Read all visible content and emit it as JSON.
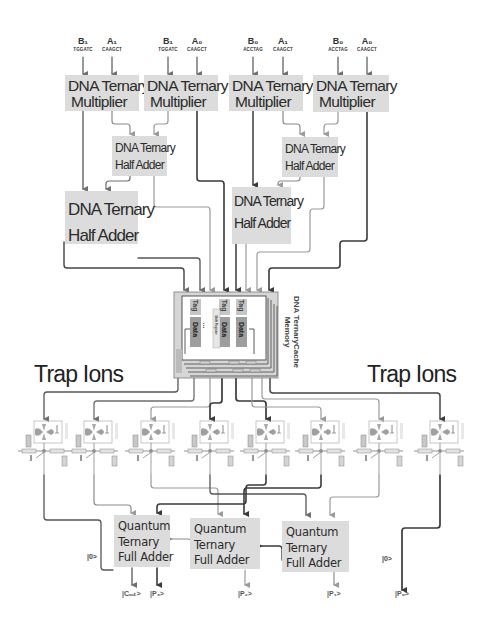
{
  "inputs": [
    {
      "id": "b1a",
      "symbol": "B₁",
      "sequence": "TGGATC",
      "x": 83
    },
    {
      "id": "a1a",
      "symbol": "A₁",
      "sequence": "CAAGCT",
      "x": 112
    },
    {
      "id": "b1b",
      "symbol": "B₁",
      "sequence": "TGGATC",
      "x": 168
    },
    {
      "id": "a0a",
      "symbol": "A₀",
      "sequence": "CAAGCT",
      "x": 197
    },
    {
      "id": "b0a",
      "symbol": "B₀",
      "sequence": "ACCTAG",
      "x": 253
    },
    {
      "id": "a1b",
      "symbol": "A₁",
      "sequence": "CAAGCT",
      "x": 283
    },
    {
      "id": "b0b",
      "symbol": "B₀",
      "sequence": "ACCTAG",
      "x": 338
    },
    {
      "id": "a0b",
      "symbol": "A₀",
      "sequence": "CAAGCT",
      "x": 367
    }
  ],
  "multipliers": [
    {
      "line1": "DNA Ternary",
      "line2": "Multiplier"
    },
    {
      "line1": "DNA Ternary",
      "line2": "Multiplier"
    },
    {
      "line1": "DNA Ternary",
      "line2": "Multiplier"
    },
    {
      "line1": "DNA Ternary",
      "line2": "Multiplier"
    }
  ],
  "half_adders": [
    {
      "line1": "DNA Ternary",
      "line2": "Half Adder"
    },
    {
      "line1": "DNA Ternary",
      "line2": "Half Adder"
    },
    {
      "line1": "DNA Ternary",
      "line2": "Half Adder"
    },
    {
      "line1": "DNA Ternary",
      "line2": "Half Adder"
    }
  ],
  "cache": {
    "title_line1": "DNA TernaryCache",
    "title_line2": "Memory",
    "cells": [
      {
        "tag": "Tag",
        "data": "Data"
      },
      {
        "tag": "Tag",
        "data": "Data",
        "sub": "Shift Register"
      },
      {
        "tag": "Tag",
        "data": "Data"
      }
    ],
    "ellipsis": "..."
  },
  "trap_ions": {
    "left_label": "Trap Ions",
    "right_label": "Trap Ions",
    "unit_side_label": "Trap Ions",
    "count": 8
  },
  "full_adders": [
    {
      "line1": "Quantum",
      "line2": "Ternary",
      "line3": "Full Adder"
    },
    {
      "line1": "Quantum",
      "line2": "Ternary",
      "line3": "Full Adder"
    },
    {
      "line1": "Quantum",
      "line2": "Ternary",
      "line3": "Full Adder"
    }
  ],
  "ancilla": {
    "left": "|0>",
    "right": "|0>"
  },
  "outputs": [
    {
      "label": "|Cₒᵤₜ>"
    },
    {
      "label": "|P₃>"
    },
    {
      "label": "|P₂>"
    },
    {
      "label": "|P₁>"
    },
    {
      "label": "|P₀>"
    }
  ],
  "colors": {
    "box_fill": "#dcdcdc",
    "line_dark": "#3a3a3a",
    "line_mid": "#6e6e6e",
    "line_light": "#9a9a9a",
    "text": "#2b2b2b"
  }
}
